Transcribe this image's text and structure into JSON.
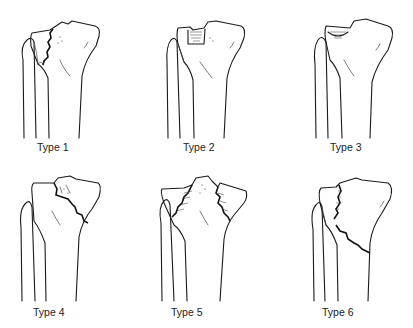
{
  "diagram": {
    "layout": "2 rows x 3 columns",
    "panels": [
      {
        "id": 1,
        "label": "Type 1"
      },
      {
        "id": 2,
        "label": "Type 2"
      },
      {
        "id": 3,
        "label": "Type 3"
      },
      {
        "id": 4,
        "label": "Type 4"
      },
      {
        "id": 5,
        "label": "Type 5"
      },
      {
        "id": 6,
        "label": "Type 6"
      }
    ]
  }
}
